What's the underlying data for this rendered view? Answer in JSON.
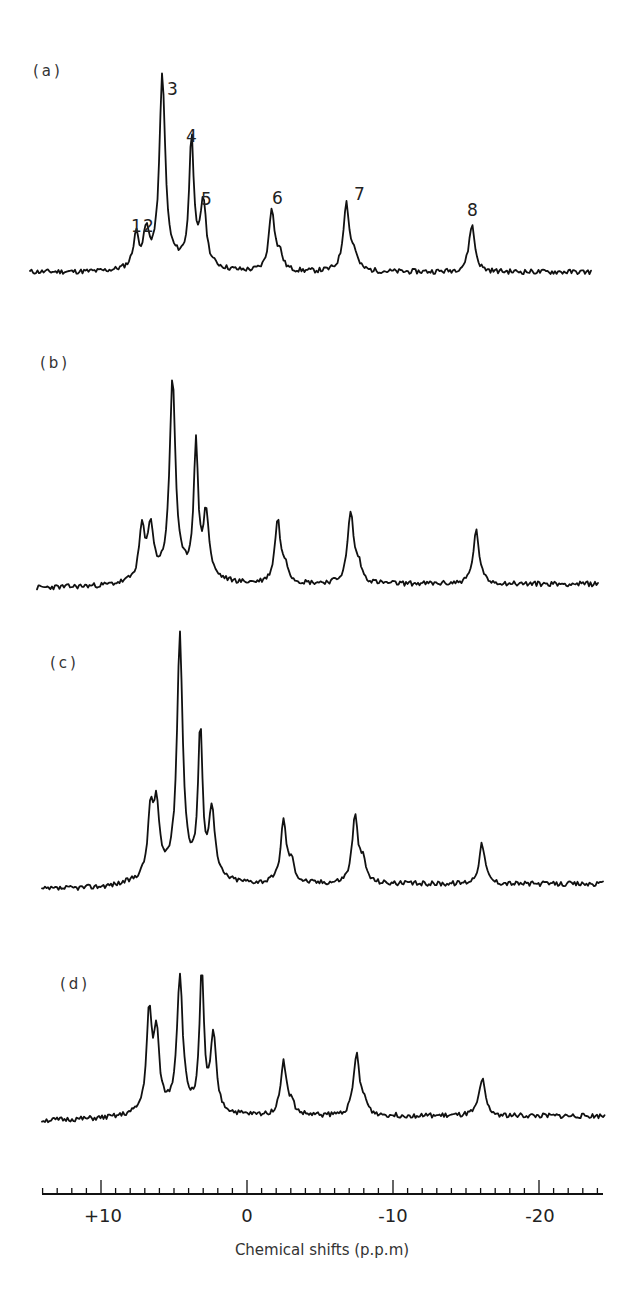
{
  "chart_data": {
    "type": "line",
    "title": "",
    "xlabel": "Chemical shifts (p.p.m)",
    "ylabel": "",
    "xlim": [
      14.2,
      -24.2
    ],
    "x_axis_reversed": true,
    "x_ticks": {
      "major": [
        10,
        0,
        -10,
        -20
      ],
      "major_labels": [
        "+10",
        "0",
        "-10",
        "-20"
      ],
      "minor_step": 1
    },
    "grid": false,
    "legend": null,
    "peak_labels": [
      "1",
      "2",
      "3",
      "4",
      "5",
      "6",
      "7",
      "8"
    ],
    "series": [
      {
        "name": "(a)",
        "baseline": 0,
        "peaks": [
          {
            "label": "1",
            "ppm": 7.6,
            "height": 0.17
          },
          {
            "label": "2",
            "ppm": 6.9,
            "height": 0.17
          },
          {
            "label": "3",
            "ppm": 5.8,
            "height": 1.0
          },
          {
            "label": "4",
            "ppm": 3.8,
            "height": 0.68
          },
          {
            "label": "5",
            "ppm": 3.0,
            "height": 0.34
          },
          {
            "label": "6",
            "ppm": -1.7,
            "height": 0.33
          },
          {
            "label": "7",
            "ppm": -6.8,
            "height": 0.36
          },
          {
            "label": "8",
            "ppm": -15.4,
            "height": 0.25
          }
        ]
      },
      {
        "name": "(b)",
        "baseline": 0,
        "peaks": [
          {
            "label": "1",
            "ppm": 7.2,
            "height": 0.26
          },
          {
            "label": "2",
            "ppm": 6.6,
            "height": 0.26
          },
          {
            "label": "3",
            "ppm": 5.1,
            "height": 1.0
          },
          {
            "label": "4",
            "ppm": 3.5,
            "height": 0.66
          },
          {
            "label": "5",
            "ppm": 2.8,
            "height": 0.32
          },
          {
            "label": "6",
            "ppm": -2.1,
            "height": 0.32
          },
          {
            "label": "7",
            "ppm": -7.1,
            "height": 0.36
          },
          {
            "label": "8",
            "ppm": -15.7,
            "height": 0.27
          }
        ]
      },
      {
        "name": "(c)",
        "baseline": 0,
        "peaks": [
          {
            "label": "1",
            "ppm": 6.6,
            "height": 0.27
          },
          {
            "label": "2",
            "ppm": 6.2,
            "height": 0.27
          },
          {
            "label": "3",
            "ppm": 4.6,
            "height": 1.0
          },
          {
            "label": "4",
            "ppm": 3.2,
            "height": 0.61
          },
          {
            "label": "5",
            "ppm": 2.4,
            "height": 0.29
          },
          {
            "label": "6",
            "ppm": -2.5,
            "height": 0.26
          },
          {
            "label": "7",
            "ppm": -7.4,
            "height": 0.28
          },
          {
            "label": "8",
            "ppm": -16.1,
            "height": 0.17
          }
        ]
      },
      {
        "name": "(d)",
        "baseline": 0,
        "peaks": [
          {
            "label": "1",
            "ppm": 6.7,
            "height": 0.71
          },
          {
            "label": "2",
            "ppm": 6.2,
            "height": 0.54
          },
          {
            "label": "3",
            "ppm": 4.6,
            "height": 0.98
          },
          {
            "label": "4",
            "ppm": 3.1,
            "height": 1.0
          },
          {
            "label": "5",
            "ppm": 2.3,
            "height": 0.55
          },
          {
            "label": "6",
            "ppm": -2.5,
            "height": 0.4
          },
          {
            "label": "7",
            "ppm": -7.5,
            "height": 0.45
          },
          {
            "label": "8",
            "ppm": -16.1,
            "height": 0.28
          }
        ]
      }
    ]
  },
  "figure": {
    "panels": [
      {
        "label": "(a)",
        "show_peak_labels": true
      },
      {
        "label": "(b)",
        "show_peak_labels": false
      },
      {
        "label": "(c)",
        "show_peak_labels": false
      },
      {
        "label": "(d)",
        "show_peak_labels": false
      }
    ],
    "axis": {
      "title": "Chemical shifts (p.p.m)",
      "tick_labels": [
        "+10",
        "0",
        "-10",
        "-20"
      ]
    },
    "peak_labels": [
      "1",
      "2",
      "3",
      "4",
      "5",
      "6",
      "7",
      "8"
    ],
    "caption_fragment": ""
  }
}
